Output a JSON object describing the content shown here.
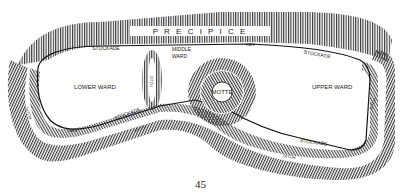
{
  "diagram": {
    "labels": {
      "precipice": "P R E C I P I C E",
      "stockade_top_left": "STOCKADE",
      "stockade_top_right": "STOCKADE",
      "stockade_bottom_left": "STOCKADE",
      "stockade_bottom_right": "STOCKADE",
      "middle_ward": [
        "MIDDLE",
        "WARD"
      ],
      "lower_ward": "LOWER WARD",
      "upper_ward": "UPPER WARD",
      "motte": "MOTTE",
      "gate_left": "GATE",
      "gate_top": "GATE",
      "ditch_left": "DITCH",
      "ditch_bottom_left": "DITCH",
      "ditch_bottom_right": "DITCH",
      "ditch_right": "DITCH",
      "ditch_middle": "DITCH"
    },
    "colors": {
      "ink": "#222222",
      "paper": "#ffffff"
    }
  },
  "page": {
    "number": "45"
  }
}
